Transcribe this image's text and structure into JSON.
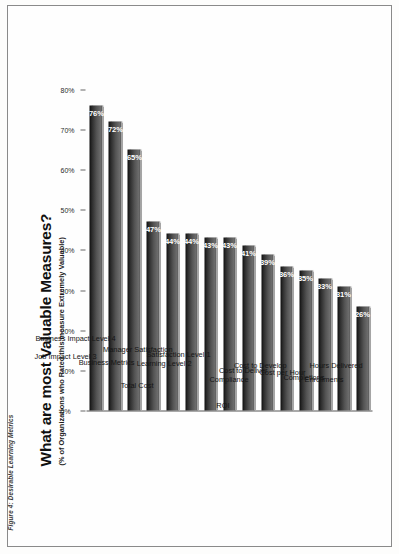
{
  "figure": {
    "caption": "Figure 4: Desirable Learning Metrics"
  },
  "chart_data": {
    "type": "bar",
    "orientation": "vertical",
    "title": "What are most Valuable Measures?",
    "subtitle": "(% of Organizations who Rated this measure Extremely Valuable)",
    "xlabel": "",
    "ylabel": "",
    "ylim": [
      0,
      80
    ],
    "grid": false,
    "legend": null,
    "tick_labels": [
      "0%",
      "10%",
      "20%",
      "30%",
      "40%",
      "50%",
      "60%",
      "70%",
      "80%"
    ],
    "tick_values": [
      0,
      10,
      20,
      30,
      40,
      50,
      60,
      70,
      80
    ],
    "categories": [
      "Job Impact Level 3",
      "Business Impact Level 4",
      "Business Metrics",
      "Total Cost",
      "Manager Satisfaction",
      "Learning Level 2",
      "Satisfaction Level 1",
      "ROI",
      "Compliance",
      "Cost to Deliver",
      "Cost to Develop",
      "Cost per Hour",
      "Completions",
      "Enrollments",
      "Hours Delivered"
    ],
    "values": [
      76,
      72,
      65,
      47,
      44,
      44,
      43,
      43,
      41,
      39,
      36,
      35,
      33,
      31,
      26
    ],
    "value_labels": [
      "76%",
      "72%",
      "65%",
      "47%",
      "44%",
      "44%",
      "43%",
      "43%",
      "41%",
      "39%",
      "36%",
      "35%",
      "33%",
      "31%",
      "26%"
    ],
    "bar_color_dark": "#0e0e0e",
    "bar_color_light": "#6e6e6e",
    "value_label_color": "#ffffff"
  }
}
